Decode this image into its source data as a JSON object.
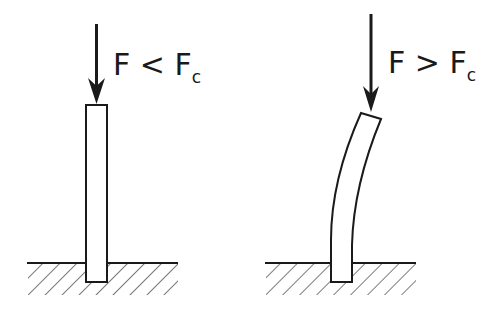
{
  "diagram": {
    "title": "",
    "panels": [
      {
        "id": "stable",
        "label_main": "F < F",
        "label_sub": "c",
        "description": "Straight column under force less than critical"
      },
      {
        "id": "buckled",
        "label_main": "F > F",
        "label_sub": "c",
        "description": "Bent (buckled) column under force greater than critical"
      }
    ],
    "colors": {
      "stroke": "#1a1a1a",
      "background": "#ffffff"
    }
  }
}
